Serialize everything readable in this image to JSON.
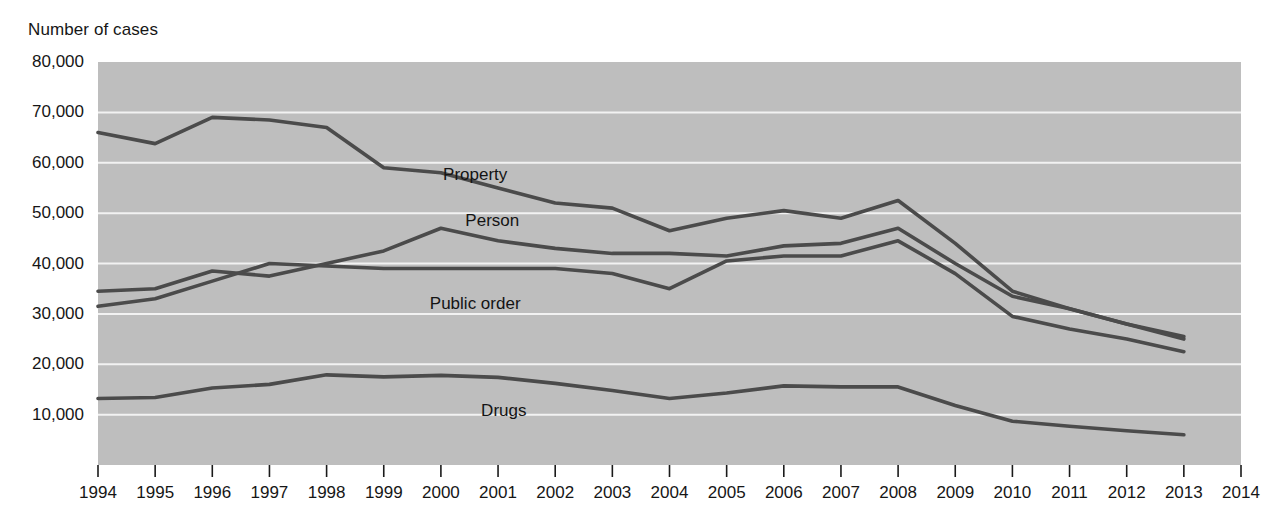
{
  "chart_data": {
    "type": "line",
    "title": "",
    "ylabel": "Number of cases",
    "xlabel": "",
    "grid": true,
    "legend_position": "inline-series-labels",
    "plot_bgcolor": "#bebebe",
    "line_color": "#4b4b4b",
    "ylim": [
      0,
      80000
    ],
    "yticks": [
      10000,
      20000,
      30000,
      40000,
      50000,
      60000,
      70000,
      80000
    ],
    "ytick_labels": [
      "10,000",
      "20,000",
      "30,000",
      "40,000",
      "50,000",
      "60,000",
      "70,000",
      "80,000"
    ],
    "xlim": [
      1994,
      2014
    ],
    "x": [
      1994,
      1995,
      1996,
      1997,
      1998,
      1999,
      2000,
      2001,
      2002,
      2003,
      2004,
      2005,
      2006,
      2007,
      2008,
      2009,
      2010,
      2011,
      2012,
      2013
    ],
    "xtick_labels": [
      "1994",
      "1995",
      "1996",
      "1997",
      "1998",
      "1999",
      "2000",
      "2001",
      "2002",
      "2003",
      "2004",
      "2005",
      "2006",
      "2007",
      "2008",
      "2009",
      "2010",
      "2011",
      "2012",
      "2013",
      "2014"
    ],
    "xticks": [
      1994,
      1995,
      1996,
      1997,
      1998,
      1999,
      2000,
      2001,
      2002,
      2003,
      2004,
      2005,
      2006,
      2007,
      2008,
      2009,
      2010,
      2011,
      2012,
      2013,
      2014
    ],
    "series": [
      {
        "name": "Property",
        "label": "Property",
        "label_x": 2000.6,
        "label_y": 57500,
        "values": [
          66000,
          63800,
          69000,
          68500,
          67000,
          59000,
          58000,
          55000,
          52000,
          51000,
          46500,
          49000,
          50500,
          49000,
          52500,
          44000,
          34500,
          31000,
          28000,
          25500
        ]
      },
      {
        "name": "Person",
        "label": "Person",
        "label_x": 2000.9,
        "label_y": 48500,
        "values": [
          34500,
          35000,
          38500,
          37500,
          40000,
          42500,
          47000,
          44500,
          43000,
          42000,
          42000,
          41500,
          43500,
          44000,
          47000,
          40000,
          33500,
          31000,
          28000,
          25000
        ]
      },
      {
        "name": "Public order",
        "label": "Public order",
        "label_x": 2000.6,
        "label_y": 32000,
        "values": [
          31500,
          33000,
          36500,
          40000,
          39500,
          39000,
          39000,
          39000,
          39000,
          38000,
          35000,
          40500,
          41500,
          41500,
          44500,
          38000,
          29500,
          27000,
          25000,
          22500
        ]
      },
      {
        "name": "Drugs",
        "label": "Drugs",
        "label_x": 2001.1,
        "label_y": 10800,
        "values": [
          13200,
          13400,
          15300,
          16000,
          17900,
          17500,
          17800,
          17400,
          16200,
          14800,
          13200,
          14300,
          15700,
          15500,
          15500,
          11800,
          8700,
          7700,
          6800,
          6000
        ]
      }
    ]
  }
}
